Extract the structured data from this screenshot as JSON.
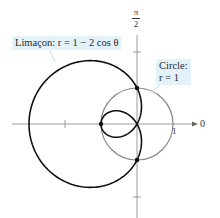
{
  "chart_data": {
    "type": "polar",
    "title": "",
    "curves": [
      {
        "name": "Limaçon",
        "equation": "r = 1 − 2 cos θ",
        "color": "#111111",
        "stroke_width": 1.6
      },
      {
        "name": "Circle",
        "equation": "r = 1",
        "color": "#8a8a8a",
        "stroke_width": 1.2
      }
    ],
    "intersection_points": [
      {
        "r": 1,
        "theta": "π/2"
      },
      {
        "r": 1,
        "theta": "3π/2"
      },
      {
        "r": -1,
        "theta": "0",
        "note": "point (1, π) on circle via inner loop"
      }
    ],
    "axes": {
      "polar_axis_label": "0",
      "vertical_axis_label": "π/2",
      "tick_labels": [
        "1"
      ],
      "tick_spacing": 2
    },
    "annotations": [
      {
        "text": "Limaçon: r = 1 − 2 cos θ"
      },
      {
        "text": "Circle: r = 1"
      }
    ]
  },
  "labels": {
    "limacon": "Limaçon: r = 1 − 2 cos θ",
    "circle_line1": "Circle:",
    "circle_line2": "r = 1",
    "pi_num": "π",
    "pi_den": "2",
    "zero": "0",
    "one": "1"
  },
  "colors": {
    "limacon": "#111111",
    "circle": "#8a8a8a",
    "axis": "#9a9a9a",
    "label_bg": "#e3f1f8"
  }
}
